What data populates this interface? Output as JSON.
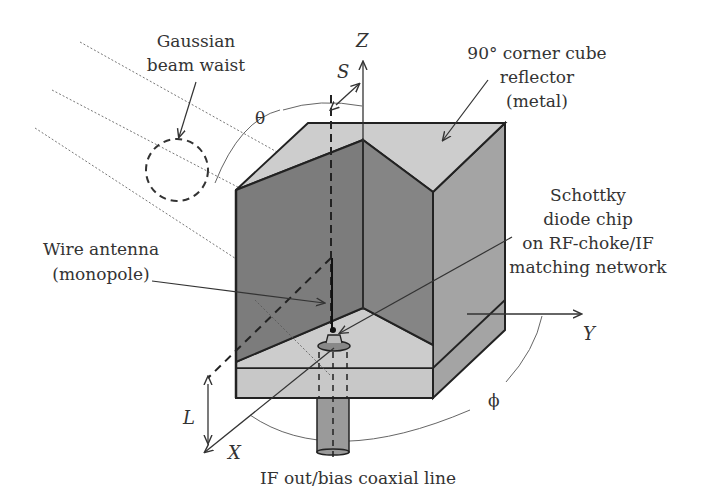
{
  "figure": {
    "labels": {
      "gaussian_line1": "Gaussian",
      "gaussian_line2": "beam waist",
      "reflector_line1": "90° corner cube",
      "reflector_line2": "reflector",
      "reflector_line3": "(metal)",
      "schottky_line1": "Schottky",
      "schottky_line2": "diode chip",
      "schottky_line3": "on RF-choke/IF",
      "schottky_line4": "matching network",
      "wire_line1": "Wire antenna",
      "wire_line2": "(monopole)",
      "coax": "IF out/bias coaxial line"
    },
    "axes": {
      "z": "Z",
      "y": "Y",
      "x": "X"
    },
    "symbols": {
      "s": "S",
      "theta": "θ",
      "phi": "ϕ",
      "l": "L"
    },
    "colors": {
      "dark_face": "#7a7a7a",
      "mid_face": "#9c9c9c",
      "light_face": "#c8c8c8",
      "outline": "#222222",
      "text": "#333333"
    }
  }
}
